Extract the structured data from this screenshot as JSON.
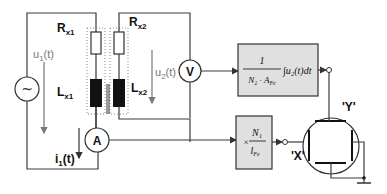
{
  "diagram": {
    "components": {
      "rx1": {
        "label": "R",
        "sub": "x1"
      },
      "rx2": {
        "label": "R",
        "sub": "x2"
      },
      "lx1": {
        "label": "L",
        "sub": "x1"
      },
      "lx2": {
        "label": "L",
        "sub": "x2"
      },
      "voltmeter": "V",
      "ammeter": "A",
      "source": "~"
    },
    "signals": {
      "u1": {
        "label": "u",
        "sub": "1",
        "suffix": "(t)"
      },
      "u2": {
        "label": "u",
        "sub": "2",
        "suffix": "(t)"
      },
      "i1": {
        "label": "i",
        "sub": "1",
        "suffix": "(t)"
      }
    },
    "integrator_block": {
      "numerator": "1",
      "denominator": "N₂ · A",
      "denominator_sub": "Fe",
      "integral": "∫u₂(t)dt"
    },
    "scale_block": {
      "prefix": "×",
      "numerator": "N₁",
      "denominator": "l",
      "denominator_sub": "Fe"
    },
    "oscilloscope": {
      "x_label": "'X'",
      "y_label": "'Y'"
    },
    "colors": {
      "wire": "#3a3a3a",
      "block_fill": "#e0e0e0",
      "signal_label": "#777777"
    }
  }
}
